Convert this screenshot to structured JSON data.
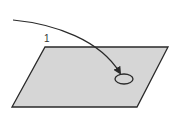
{
  "diagram": {
    "step_label": "1",
    "colors": {
      "surface_fill": "#d6d6d6",
      "stroke": "#2a2a2a",
      "background": "#ffffff"
    },
    "elements": [
      {
        "type": "parallelogram-surface",
        "description": "flat tilted plane"
      },
      {
        "type": "curved-arrow",
        "description": "arrow pointing to target spot on surface"
      },
      {
        "type": "ellipse-target",
        "description": "circular target mark on surface"
      },
      {
        "type": "text-label",
        "text": "1"
      }
    ]
  }
}
